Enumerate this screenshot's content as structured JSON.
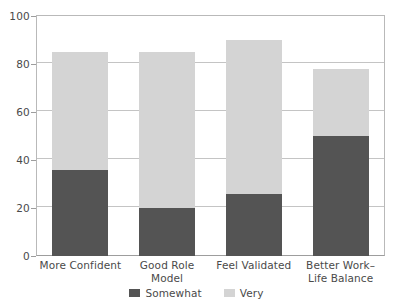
{
  "chart_data": {
    "type": "bar",
    "subtype": "stacked-bar",
    "title": "",
    "xlabel": "",
    "ylabel": "",
    "ylim": [
      0,
      100
    ],
    "ytick_step": 20,
    "yticks": [
      0,
      20,
      40,
      60,
      80,
      100
    ],
    "ytick_labels": [
      "0",
      "20",
      "40",
      "60",
      "80",
      "100"
    ],
    "grid": "horizontal",
    "legend_position": "bottom-center",
    "categories": [
      "More Confident",
      "Good Role Model",
      "Feel Validated",
      "Better Work–Life Balance"
    ],
    "category_lines": [
      [
        "More Confident"
      ],
      [
        "Good Role Model"
      ],
      [
        "Feel Validated"
      ],
      [
        "Better Work–",
        "Life Balance"
      ]
    ],
    "series": [
      {
        "name": "Somewhat",
        "color": "#545454",
        "values": [
          36,
          20,
          26,
          50
        ]
      },
      {
        "name": "Very",
        "color": "#d4d4d4",
        "values": [
          49,
          65,
          64,
          28
        ]
      }
    ],
    "totals": [
      85,
      85,
      90,
      78
    ]
  },
  "legend": {
    "items": [
      {
        "label": "Somewhat",
        "color": "#545454"
      },
      {
        "label": "Very",
        "color": "#d4d4d4"
      }
    ]
  },
  "axis": {
    "y_max_label": "100",
    "y_min_label": "0"
  },
  "colors": {
    "somewhat": "#545454",
    "very": "#d4d4d4",
    "grid": "#c4c4c4",
    "axis": "#9d9d9d",
    "text": "#4a4a4a",
    "background": "#ffffff"
  }
}
